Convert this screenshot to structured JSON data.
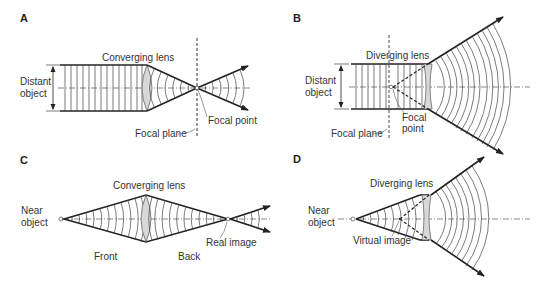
{
  "figure": {
    "panels": [
      {
        "id": "A",
        "labels": {
          "panel": "A",
          "lens": "Converging lens",
          "object": [
            "Distant",
            "object"
          ],
          "focal_point": "Focal point",
          "focal_plane": "Focal plane"
        }
      },
      {
        "id": "B",
        "labels": {
          "panel": "B",
          "lens": "Diverging lens",
          "object": [
            "Distant",
            "object"
          ],
          "focal_point": [
            "Focal",
            "point"
          ],
          "focal_plane": "Focal plane"
        }
      },
      {
        "id": "C",
        "labels": {
          "panel": "C",
          "lens": "Converging lens",
          "object": [
            "Near",
            "object"
          ],
          "image": "Real image",
          "front": "Front",
          "back": "Back"
        }
      },
      {
        "id": "D",
        "labels": {
          "panel": "D",
          "lens": "Diverging lens",
          "object": [
            "Near",
            "object"
          ],
          "image": "Virtual image"
        }
      }
    ],
    "colors": {
      "ray": "#222222",
      "wavefront": "#444444",
      "lens_fill": "#d8d8d8",
      "axis": "#555555"
    }
  }
}
